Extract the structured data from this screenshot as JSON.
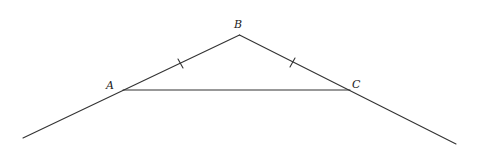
{
  "diagram": {
    "labels": {
      "A": "A",
      "B": "B",
      "C": "C"
    },
    "points": {
      "A": [
        123,
        90
      ],
      "B": [
        239.5,
        35
      ],
      "C": [
        350,
        90
      ],
      "ext_left": [
        23,
        138
      ],
      "ext_right": [
        456,
        144
      ]
    },
    "tick_marks": [
      "AB",
      "BC"
    ],
    "colors": {
      "line": "#333333",
      "background": "#ffffff"
    }
  }
}
